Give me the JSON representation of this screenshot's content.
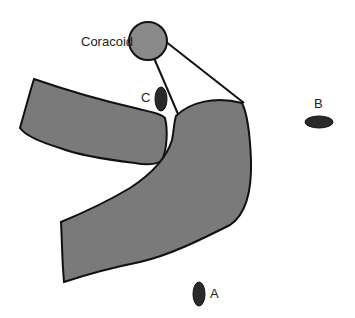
{
  "labels": {
    "coracoid": "Coracoid",
    "a": "A",
    "b": "B",
    "c": "C"
  },
  "colors": {
    "bone_fill": "#7a7a7a",
    "coracoid_fill": "#8a8a8a",
    "outline": "#111111",
    "marker_fill": "#2a2a2a"
  }
}
